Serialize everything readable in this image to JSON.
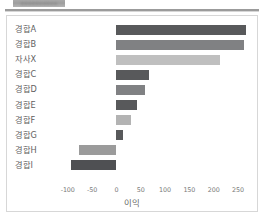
{
  "header": {
    "redacted_title_placeholder": "▪▪▪▪▪▪▪▪▪▪"
  },
  "chart_data": {
    "type": "bar",
    "orientation": "horizontal",
    "title": "",
    "xlabel": "이익",
    "ylabel": "",
    "categories": [
      "경합A",
      "경합B",
      "자사X",
      "경합C",
      "경합D",
      "경합E",
      "경합F",
      "경합G",
      "경합H",
      "경합I"
    ],
    "values": [
      267,
      262,
      214,
      68,
      58,
      42,
      31,
      13,
      -77,
      -94
    ],
    "bar_colors": [
      "#58595b",
      "#808183",
      "#bfbfbf",
      "#58595b",
      "#808183",
      "#58595b",
      "#b3b3b3",
      "#58595b",
      "#9b9b9b",
      "#4f5053"
    ],
    "xlim": [
      -118,
      285
    ],
    "xticks": [
      -100,
      -50,
      0,
      50,
      100,
      150,
      200,
      250
    ],
    "xtick_labels": [
      "-100",
      "-50",
      "0",
      "50",
      "100",
      "150",
      "200",
      "250"
    ],
    "grid": false,
    "legend": null
  },
  "colors": {
    "dark_grey": "#58595b",
    "mid_grey": "#808183",
    "light_grey": "#bfbfbf",
    "card_border": "#d7d7d7",
    "divider": "#9b9b9b",
    "text": "#5f5f5f",
    "tick_text": "#7a7a7a"
  }
}
